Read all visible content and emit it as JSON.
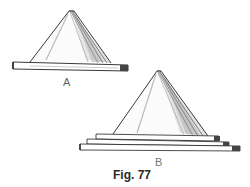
{
  "figure": {
    "caption": "Fig. 77",
    "panels": [
      {
        "id": "A",
        "label": "A",
        "description": "pyramid-shaped cover resting on a single base board"
      },
      {
        "id": "B",
        "label": "B",
        "description": "pyramid-shaped cover resting on three stacked base boards",
        "base_layers": 3
      }
    ]
  },
  "colors": {
    "ink": "#222222",
    "shade": "#9a9a9a",
    "light_shade": "#cfcfcf",
    "paper": "#ffffff"
  }
}
